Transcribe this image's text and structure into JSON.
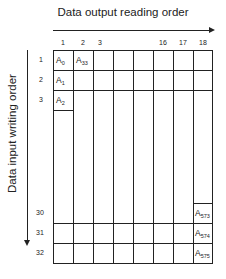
{
  "diagram": {
    "top_title": "Data output reading order",
    "side_title": "Data input writing order",
    "column_labels": [
      "1",
      "2",
      "3",
      "",
      "",
      "16",
      "17",
      "18"
    ],
    "row_labels_top": [
      "1",
      "2",
      "3"
    ],
    "row_labels_bottom": [
      "30",
      "31",
      "32"
    ],
    "cells": {
      "r1c1": {
        "base": "A",
        "sub": "0"
      },
      "r1c2": {
        "base": "A",
        "sub": "33"
      },
      "r2c1": {
        "base": "A",
        "sub": "1"
      },
      "r3c1": {
        "base": "A",
        "sub": "2"
      },
      "r30c18": {
        "base": "A",
        "sub": "573"
      },
      "r31c18": {
        "base": "A",
        "sub": "574"
      },
      "r32c18": {
        "base": "A",
        "sub": "575"
      }
    },
    "colors": {
      "line": "#222222",
      "background": "#ffffff"
    }
  }
}
